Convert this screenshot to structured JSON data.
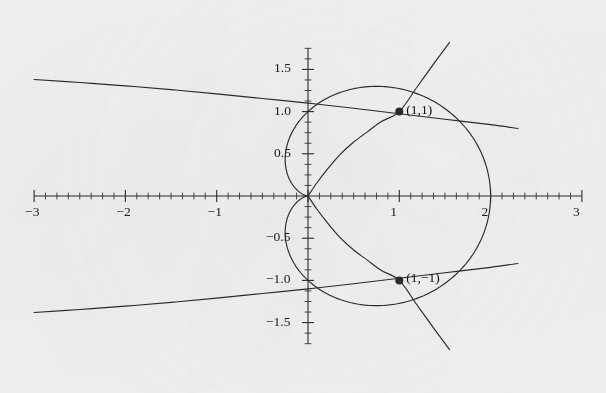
{
  "figure": {
    "background_color": "#f3f2f0",
    "ink_color": "#2b2b2b",
    "label_color": "#1b1b1b"
  },
  "chart_data": {
    "type": "line",
    "title": "",
    "subtitle": "",
    "xlabel": "",
    "ylabel": "",
    "xlim": [
      -3,
      3
    ],
    "ylim": [
      -1.75,
      1.75
    ],
    "grid": false,
    "legend": "none",
    "axes": {
      "x_axis_label_text": "",
      "y_axis_label_text": "",
      "x_ticks_major": [
        -3,
        -2,
        -1,
        0,
        1,
        2,
        3
      ],
      "x_tick_labels": [
        "-3",
        "-2",
        "-1",
        "",
        "1",
        "2",
        "3"
      ],
      "x_ticks_minor_step": 0.125,
      "y_ticks_major": [
        -1.5,
        -1.0,
        -0.5,
        0.5,
        1.0,
        1.5
      ],
      "y_tick_labels": [
        "-1.5",
        "-1.0",
        "-0.5",
        "0.5",
        "1.0",
        "1.5"
      ],
      "y_ticks_minor_step": 0.125,
      "arrow_heads": false,
      "axis_style": "cartesian-cross"
    },
    "annotations": [
      {
        "name": "intersection-upper",
        "x": 1,
        "y": 1,
        "label": "(1,1)",
        "marker": "filled-dot"
      },
      {
        "name": "intersection-lower",
        "x": 1,
        "y": -1,
        "label": "(1,−1)",
        "marker": "filled-dot"
      }
    ],
    "series": [
      {
        "name": "cardioid",
        "equation": "r = 1 + cos(theta)",
        "description": "Cardioid passing through origin, (2,0), (1,1) and (1,-1)",
        "x": [
          0.0,
          0.0335,
          0.1226,
          0.25,
          0.4045,
          0.5721,
          0.75,
          0.9284,
          1.1034,
          1.25,
          1.4045,
          1.5721,
          1.75,
          1.9284,
          2.0,
          1.9284,
          1.75,
          1.5721,
          1.4045,
          1.25,
          1.1034,
          0.9284,
          0.75,
          0.5721,
          0.4045,
          0.25,
          0.1226,
          0.0335,
          0.0
        ],
        "y": [
          0.0,
          -0.183,
          -0.3248,
          -0.433,
          -0.5068,
          -0.5406,
          -0.5335,
          -0.4855,
          -0.398,
          -0.25,
          -0.0665,
          0.1545,
          0.375,
          0.6005,
          0.0,
          -0.6005,
          -0.375,
          -0.1545,
          0.0665,
          0.25,
          0.398,
          0.4855,
          0.5335,
          0.5406,
          0.5068,
          0.433,
          0.3248,
          0.183,
          0.0
        ]
      },
      {
        "name": "upper-shallow-branch",
        "description": "Shallow decreasing curve entering from upper-left, passing through (1,1)",
        "x": [
          -3.0,
          -2.5,
          -2.0,
          -1.5,
          -1.0,
          -0.5,
          0.0,
          0.5,
          1.0,
          1.5,
          2.0,
          2.3
        ],
        "y": [
          1.38,
          1.345,
          1.305,
          1.26,
          1.21,
          1.155,
          1.1,
          1.04,
          0.975,
          0.91,
          0.845,
          0.8
        ]
      },
      {
        "name": "lower-shallow-branch",
        "description": "Shallow increasing curve entering from lower-left, passing through (1,-1)",
        "x": [
          -3.0,
          -2.5,
          -2.0,
          -1.5,
          -1.0,
          -0.5,
          0.0,
          0.5,
          1.0,
          1.5,
          2.0,
          2.3
        ],
        "y": [
          -1.38,
          -1.345,
          -1.305,
          -1.26,
          -1.21,
          -1.155,
          -1.1,
          -1.04,
          -0.975,
          -0.91,
          -0.845,
          -0.8
        ]
      },
      {
        "name": "rising-branch-through-origin",
        "description": "Steep curve from the origin rising to the upper right through (1,1)",
        "x": [
          0.0,
          0.1,
          0.2,
          0.35,
          0.5,
          0.65,
          0.8,
          1.0,
          1.2,
          1.4,
          1.55
        ],
        "y": [
          0.0,
          0.16,
          0.3,
          0.49,
          0.64,
          0.76,
          0.88,
          1.0,
          1.3,
          1.6,
          1.82
        ]
      },
      {
        "name": "falling-branch-through-origin",
        "description": "Steep curve from the origin falling to the lower right through (1,-1)",
        "x": [
          0.0,
          0.1,
          0.2,
          0.35,
          0.5,
          0.65,
          0.8,
          1.0,
          1.2,
          1.4,
          1.55
        ],
        "y": [
          0.0,
          -0.16,
          -0.3,
          -0.49,
          -0.64,
          -0.76,
          -0.88,
          -1.0,
          -1.3,
          -1.6,
          -1.82
        ]
      }
    ]
  }
}
